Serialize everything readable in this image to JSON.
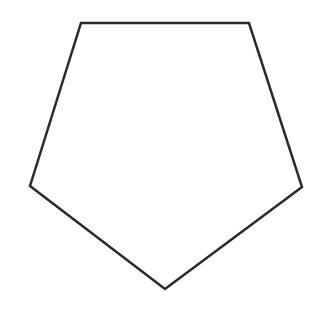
{
  "diagram": {
    "shape": "pentagon",
    "vertices": [
      [
        81,
        23
      ],
      [
        249,
        23
      ],
      [
        302,
        187
      ],
      [
        165,
        289
      ],
      [
        30,
        186
      ]
    ],
    "stroke": "#2a2a2a",
    "stroke_width": 2.5,
    "fill": "#ffffff",
    "background": "#ffffff"
  }
}
